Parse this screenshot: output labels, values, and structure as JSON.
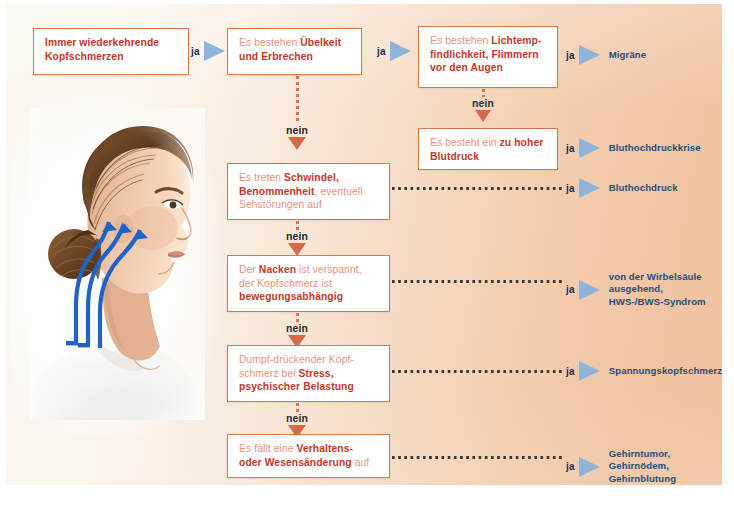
{
  "diagram": {
    "colors": {
      "box_border": "#e0714a",
      "text_light": "#e8907a",
      "text_bold": "#c3372a",
      "arrow_blue": "#8fb4db",
      "result_blue": "#1f4e79",
      "arrow_orange": "#d6694a",
      "background_left": "#fbf8f1",
      "background_right": "#f0c2a0"
    }
  },
  "photo": {
    "alt": "Frau im Profil mit blauen Pfeilen vom Nacken zum Kopf",
    "arrow_color": "#1f63c4"
  },
  "labels": {
    "ja": "ja",
    "nein": "nein"
  },
  "boxes": {
    "start": {
      "line1": "Immer wiederkehrende",
      "line2": "Kopfschmerzen"
    },
    "nausea": {
      "pre1": "Es bestehen ",
      "bold1": "Übelkeit",
      "bold2": "und Erbrechen"
    },
    "light": {
      "pre1": "Es bestehen ",
      "bold1": "Lichtemp-",
      "bold2": "findlichkeit, Flimmern",
      "bold3": "vor den Augen"
    },
    "bloodpressure": {
      "pre1": "Es besteht ein ",
      "bold1": "zu hoher",
      "bold2": "Blutdruck"
    },
    "dizziness": {
      "pre1": "Es treten ",
      "bold1": "Schwindel,",
      "bold2": "Benommenheit",
      "post2": ", eventuell",
      "line3": "Sehstörungen auf"
    },
    "neck": {
      "pre1": "Der ",
      "bold1": "Nacken",
      "post1": " ist verspannt,",
      "line2": "der Kopfschmerz ist",
      "bold3": "bewegungsabhängig"
    },
    "stress": {
      "line1": "Dumpf-drückender Kopf-",
      "pre2": "schmerz bei ",
      "bold2": "Stress,",
      "bold3": "psychischer Belastung"
    },
    "behaviour": {
      "pre1": "Es fällt eine ",
      "bold1": "Verhaltens-",
      "bold2": "oder Wesensänderung",
      "post2": " auf"
    }
  },
  "results": {
    "migraene": "Migräne",
    "krise": "Bluthochdruckkrise",
    "hochdruck": "Bluthochdruck",
    "hws_line1": "von der Wirbelsäule",
    "hws_line2": "ausgehend,",
    "hws_line3": "HWS-/BWS-Syndrom",
    "spannung": "Spannungskopfschmerz",
    "gehirn_line1": "Gehirntumor,",
    "gehirn_line2": "Gehirnödem,",
    "gehirn_line3": "Gehirnblutung"
  }
}
